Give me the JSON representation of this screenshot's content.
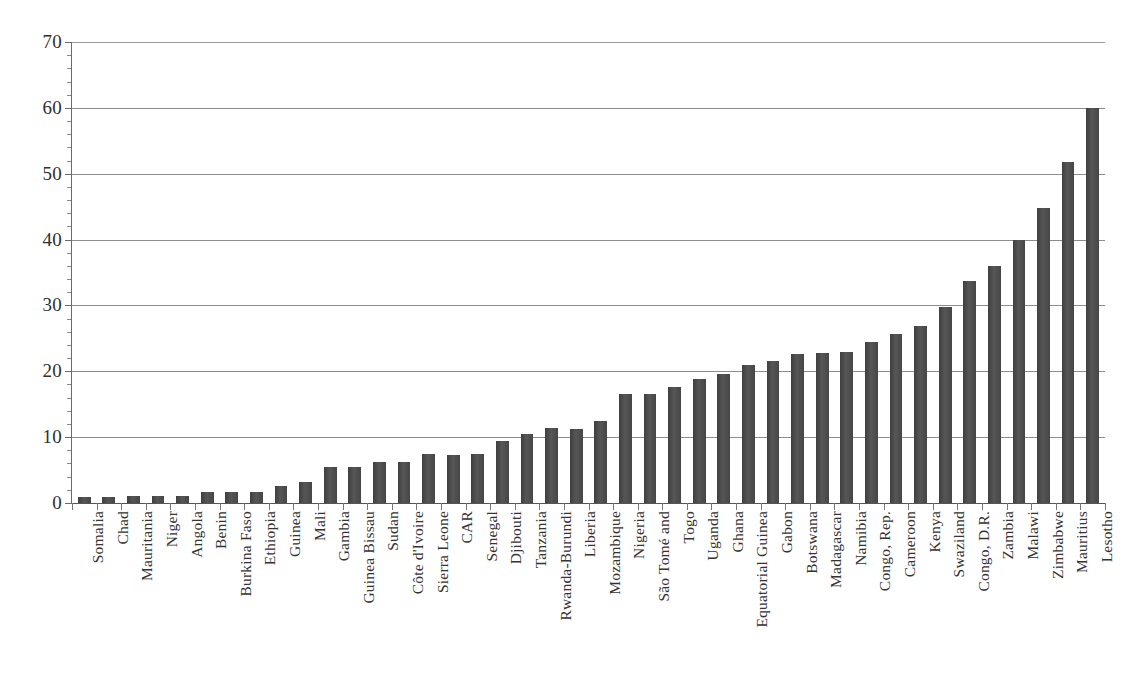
{
  "chart_data": {
    "type": "bar",
    "title": "",
    "subtitle": "",
    "xlabel": "",
    "ylabel": "",
    "ylim": [
      0,
      70
    ],
    "ytick_step": 10,
    "ytick_labels": [
      "70",
      "60",
      "50",
      "40",
      "30",
      "20",
      "10",
      "0"
    ],
    "ytick_values": [
      70,
      60,
      50,
      40,
      30,
      20,
      10,
      0
    ],
    "grid": true,
    "grid_axis": "y",
    "legend": null,
    "legend_position": "none",
    "orientation": "vertical",
    "bar_color": "#4a4a4a",
    "gridline_color": "#8c8c8c",
    "axis_color": "#6b6b6b",
    "background": "#ffffff",
    "categories": [
      "Somalia",
      "Chad",
      "Mauritania",
      "Niger",
      "Angola",
      "Benin",
      "Burkina Faso",
      "Ethiopia",
      "Guinea",
      "Mali",
      "Gambia",
      "Guinea Bissau",
      "Sudan",
      "Côte d'Ivoire",
      "Sierra Leone",
      "CAR",
      "Senegal",
      "Djibouti",
      "Tanzania",
      "Rwanda-Burundi",
      "Liberia",
      "Mozambique",
      "Nigeria",
      "São Tomé and",
      "Togo",
      "Uganda",
      "Ghana",
      "Equatorial Guinea",
      "Gabon",
      "Botswana",
      "Madagascar",
      "Namibia",
      "Congo, Rep.",
      "Cameroon",
      "Kenya",
      "Swaziland",
      "Congo, D.R.",
      "Zambia",
      "Malawi",
      "Zimbabwe",
      "Mauritius",
      "Lesotho"
    ],
    "values": [
      0.9,
      0.9,
      1.0,
      1.0,
      1.0,
      1.6,
      1.7,
      1.7,
      2.6,
      3.2,
      5.4,
      5.4,
      6.2,
      6.3,
      7.4,
      7.3,
      7.4,
      9.4,
      10.5,
      11.4,
      11.3,
      12.4,
      16.6,
      16.5,
      17.6,
      18.8,
      19.6,
      20.9,
      21.5,
      22.7,
      22.8,
      22.9,
      24.4,
      25.7,
      26.9,
      29.8,
      33.7,
      36.0,
      40.0,
      44.8,
      51.8,
      60.0
    ]
  }
}
